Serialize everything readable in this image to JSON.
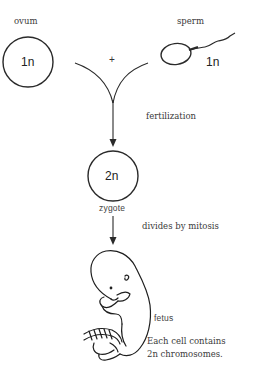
{
  "diagram": {
    "ovum": {
      "label": "ovum",
      "ploidy": "1n"
    },
    "sperm": {
      "label": "sperm",
      "ploidy": "1n"
    },
    "plus_sign": "+",
    "fertilization_label": "fertilization",
    "zygote": {
      "label": "zygote",
      "ploidy": "2n"
    },
    "mitosis_label": "divides by mitosis",
    "fetus": {
      "label": "fetus",
      "note_line1": "Each cell contains",
      "note_line2": "2n chromosomes."
    },
    "colors": {
      "stroke": "#2a2a2a",
      "text": "#3a3a3a",
      "background": "#ffffff"
    }
  }
}
